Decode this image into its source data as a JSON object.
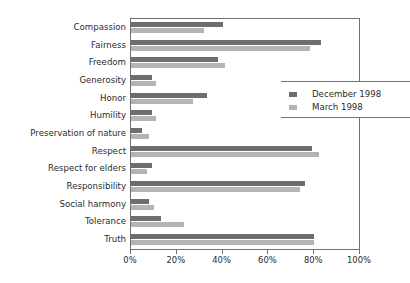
{
  "chart_data": {
    "type": "bar",
    "orientation": "horizontal",
    "title": "",
    "xlabel": "",
    "ylabel": "",
    "xlim": [
      0,
      100
    ],
    "xticks": [
      "0%",
      "20%",
      "40%",
      "60%",
      "80%",
      "100%"
    ],
    "xtick_values": [
      0,
      20,
      40,
      60,
      80,
      100
    ],
    "grid": false,
    "legend_position": "right",
    "categories": [
      "Compassion",
      "Fairness",
      "Freedom",
      "Generosity",
      "Honor",
      "Humility",
      "Preservation of nature",
      "Respect",
      "Respect for elders",
      "Responsibility",
      "Social harmony",
      "Tolerance",
      "Truth"
    ],
    "series": [
      {
        "name": "December 1998",
        "color": "#6e6e6e",
        "values": [
          40,
          83,
          38,
          9,
          33,
          9,
          5,
          79,
          9,
          76,
          8,
          13,
          80
        ]
      },
      {
        "name": "March 1998",
        "color": "#b4b4b4",
        "values": [
          32,
          78,
          41,
          11,
          27,
          11,
          8,
          82,
          7,
          74,
          10,
          23,
          80
        ]
      }
    ]
  },
  "legend": {
    "items": [
      {
        "label": "December 1998",
        "color": "#6e6e6e"
      },
      {
        "label": "March 1998",
        "color": "#b4b4b4"
      }
    ]
  }
}
